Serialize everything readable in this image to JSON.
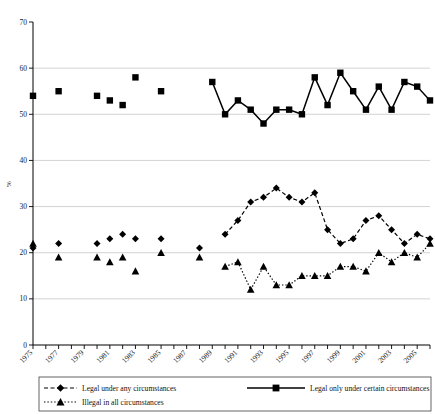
{
  "chart_data": {
    "type": "line",
    "title": "",
    "xlabel": "",
    "ylabel": "%",
    "ylim": [
      0,
      70
    ],
    "ytick_step": 10,
    "yticks": [
      "0",
      "10",
      "20",
      "30",
      "40",
      "50",
      "60",
      "70"
    ],
    "grid": true,
    "xlim": [
      1975,
      2006
    ],
    "xticks": [
      "1975",
      "1977",
      "1979",
      "1981",
      "1983",
      "1985",
      "1987",
      "1989",
      "1991",
      "1993",
      "1995",
      "1997",
      "1999",
      "2001",
      "2003",
      "2005"
    ],
    "xtick_label_rotation": -45,
    "legend_position": "bottom",
    "series": [
      {
        "name": "Legal under any circumstances",
        "marker": "diamond",
        "line_style": "dashed",
        "color": "#000000",
        "points": [
          {
            "x": 1975,
            "y": 21
          },
          {
            "x": 1977,
            "y": 22
          },
          {
            "x": 1980,
            "y": 22
          },
          {
            "x": 1981,
            "y": 23
          },
          {
            "x": 1982,
            "y": 24
          },
          {
            "x": 1983,
            "y": 23
          },
          {
            "x": 1985,
            "y": 23
          },
          {
            "x": 1988,
            "y": 21
          },
          {
            "x": 1990,
            "y": 24
          },
          {
            "x": 1991,
            "y": 27
          },
          {
            "x": 1992,
            "y": 31
          },
          {
            "x": 1993,
            "y": 32
          },
          {
            "x": 1994,
            "y": 34
          },
          {
            "x": 1995,
            "y": 32
          },
          {
            "x": 1996,
            "y": 31
          },
          {
            "x": 1997,
            "y": 33
          },
          {
            "x": 1998,
            "y": 25
          },
          {
            "x": 1999,
            "y": 22
          },
          {
            "x": 2000,
            "y": 23
          },
          {
            "x": 2001,
            "y": 27
          },
          {
            "x": 2002,
            "y": 28
          },
          {
            "x": 2003,
            "y": 25
          },
          {
            "x": 2004,
            "y": 22
          },
          {
            "x": 2005,
            "y": 24
          },
          {
            "x": 2006,
            "y": 23
          }
        ],
        "connected_from": 1990
      },
      {
        "name": "Legal only under certain circumstances",
        "marker": "square",
        "line_style": "solid",
        "color": "#000000",
        "points": [
          {
            "x": 1975,
            "y": 54
          },
          {
            "x": 1977,
            "y": 55
          },
          {
            "x": 1980,
            "y": 54
          },
          {
            "x": 1981,
            "y": 53
          },
          {
            "x": 1982,
            "y": 52
          },
          {
            "x": 1983,
            "y": 58
          },
          {
            "x": 1985,
            "y": 55
          },
          {
            "x": 1989,
            "y": 57
          },
          {
            "x": 1990,
            "y": 50
          },
          {
            "x": 1991,
            "y": 53
          },
          {
            "x": 1992,
            "y": 51
          },
          {
            "x": 1993,
            "y": 48
          },
          {
            "x": 1994,
            "y": 51
          },
          {
            "x": 1995,
            "y": 51
          },
          {
            "x": 1996,
            "y": 50
          },
          {
            "x": 1997,
            "y": 58
          },
          {
            "x": 1998,
            "y": 52
          },
          {
            "x": 1999,
            "y": 59
          },
          {
            "x": 2000,
            "y": 55
          },
          {
            "x": 2001,
            "y": 51
          },
          {
            "x": 2002,
            "y": 56
          },
          {
            "x": 2003,
            "y": 51
          },
          {
            "x": 2004,
            "y": 57
          },
          {
            "x": 2005,
            "y": 56
          },
          {
            "x": 2006,
            "y": 53
          }
        ],
        "connected_from": 1989
      },
      {
        "name": "Illegal in all circumstances",
        "marker": "triangle",
        "line_style": "dotted",
        "color": "#000000",
        "points": [
          {
            "x": 1975,
            "y": 22
          },
          {
            "x": 1977,
            "y": 19
          },
          {
            "x": 1980,
            "y": 19
          },
          {
            "x": 1981,
            "y": 18
          },
          {
            "x": 1982,
            "y": 19
          },
          {
            "x": 1983,
            "y": 16
          },
          {
            "x": 1985,
            "y": 20
          },
          {
            "x": 1988,
            "y": 19
          },
          {
            "x": 1990,
            "y": 17
          },
          {
            "x": 1991,
            "y": 18
          },
          {
            "x": 1992,
            "y": 12
          },
          {
            "x": 1993,
            "y": 17
          },
          {
            "x": 1994,
            "y": 13
          },
          {
            "x": 1995,
            "y": 13
          },
          {
            "x": 1996,
            "y": 15
          },
          {
            "x": 1997,
            "y": 15
          },
          {
            "x": 1998,
            "y": 15
          },
          {
            "x": 1999,
            "y": 17
          },
          {
            "x": 2000,
            "y": 17
          },
          {
            "x": 2001,
            "y": 16
          },
          {
            "x": 2002,
            "y": 20
          },
          {
            "x": 2003,
            "y": 18
          },
          {
            "x": 2004,
            "y": 20
          },
          {
            "x": 2005,
            "y": 19
          },
          {
            "x": 2006,
            "y": 22
          }
        ],
        "connected_from": 1990
      }
    ]
  },
  "legend": {
    "items": [
      {
        "label": "Legal under any circumstances",
        "marker": "diamond",
        "line_style": "dashed"
      },
      {
        "label": "Legal only under certain circumstances",
        "marker": "square",
        "line_style": "solid"
      },
      {
        "label": "Illegal in all circumstances",
        "marker": "triangle",
        "line_style": "dotted"
      }
    ]
  },
  "colors": {
    "ink": "#000000",
    "grid": "#c8c8c8",
    "legend_border": "#555555"
  }
}
